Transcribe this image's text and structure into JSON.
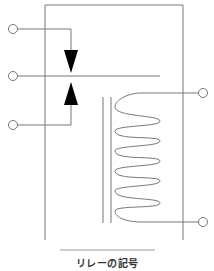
{
  "diagram": {
    "title": "リレーの記号",
    "type": "relay-symbol",
    "components": {
      "contacts": "changeover contact with two triangular contact points",
      "coil": "solenoid coil with 6 loops",
      "core": "iron core (double vertical line)",
      "terminals": 5
    },
    "colors": {
      "line": "#777777",
      "fill": "#000000",
      "caption": "#333333",
      "background": "#ffffff"
    }
  }
}
